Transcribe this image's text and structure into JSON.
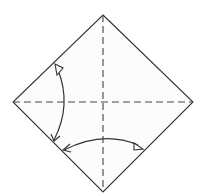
{
  "diagram": {
    "paper": {
      "shape": "square rotated 45 degrees",
      "vertices": {
        "top": [
          103,
          15
        ],
        "right": [
          193,
          102
        ],
        "bottom": [
          103,
          192
        ],
        "left": [
          13,
          102
        ]
      },
      "fill": "#fcfcfc",
      "stroke": "#333333"
    },
    "creases": [
      {
        "type": "valley-fold",
        "style": "dashed",
        "from": [
          13,
          102
        ],
        "to": [
          193,
          102
        ]
      },
      {
        "type": "valley-fold",
        "style": "dashed",
        "from": [
          103,
          15
        ],
        "to": [
          103,
          192
        ]
      }
    ],
    "arrows": [
      {
        "name": "fold-and-unfold-arrow-left",
        "from": [
          54,
          141
        ],
        "to": [
          58,
          67
        ],
        "style": "curved, open head at top, barbed head at bottom"
      },
      {
        "name": "fold-and-unfold-arrow-bottom",
        "from": [
          63,
          150
        ],
        "to": [
          141,
          147
        ],
        "style": "curved, barbed head at left, open head at right"
      }
    ],
    "colors": {
      "line": "#333333",
      "paper": "#fcfcfc",
      "background": "#ffffff"
    }
  }
}
